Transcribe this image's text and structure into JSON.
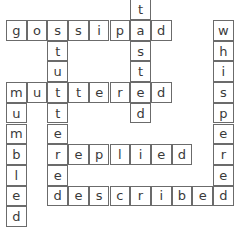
{
  "puzzle": {
    "type": "crossword",
    "cell_size": 20.7,
    "origin": {
      "x": 6,
      "y": 20
    },
    "words": [
      {
        "word": "gossiped",
        "direction": "across",
        "row": 0,
        "col": 0
      },
      {
        "word": "tasted",
        "direction": "down",
        "row": -1,
        "col": 6
      },
      {
        "word": "stuttered",
        "direction": "down",
        "row": 0,
        "col": 2
      },
      {
        "word": "whispered",
        "direction": "down",
        "row": 0,
        "col": 10
      },
      {
        "word": "muttered",
        "direction": "across",
        "row": 3,
        "col": 0
      },
      {
        "word": "mumbled",
        "direction": "down",
        "row": 3,
        "col": 0
      },
      {
        "word": "replied",
        "direction": "across",
        "row": 6,
        "col": 2
      },
      {
        "word": "described",
        "direction": "across",
        "row": 8,
        "col": 2
      }
    ]
  }
}
